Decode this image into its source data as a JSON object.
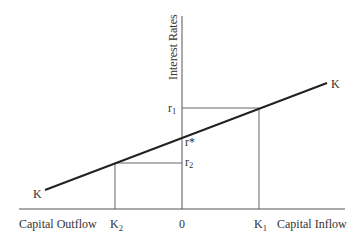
{
  "diagram": {
    "y_axis_label": "Interest Rates",
    "x_axis_left_label": "Capital Outflow",
    "x_axis_right_label": "Capital Inflow",
    "origin_label": "0",
    "curve_label_left": "K",
    "curve_label_right": "K",
    "r1": {
      "base": "r",
      "sub": "1"
    },
    "r_star": "r*",
    "r2": {
      "base": "r",
      "sub": "2"
    },
    "k1": {
      "base": "K",
      "sub": "1"
    },
    "k2": {
      "base": "K",
      "sub": "2"
    },
    "colors": {
      "axis": "#555555",
      "curve": "#222222",
      "guide": "#666666",
      "text": "#333333"
    }
  }
}
